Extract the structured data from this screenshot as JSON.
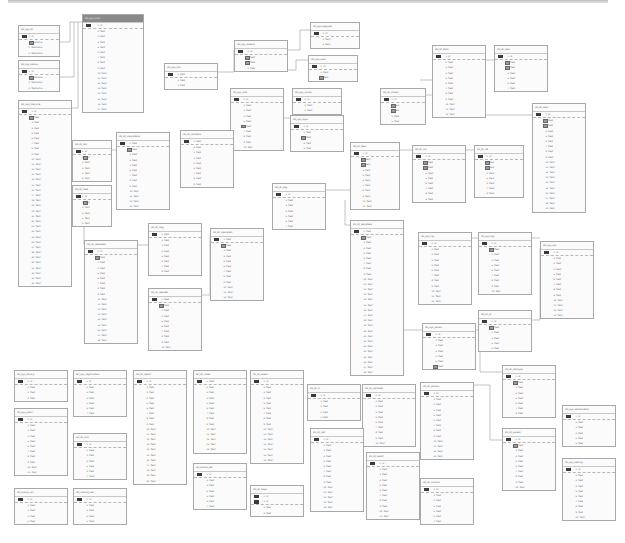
{
  "diagram": {
    "type": "entity-relationship",
    "tables": [
      {
        "name": "tbl_sys_dt",
        "x": 18,
        "y": 25,
        "w": 42,
        "rows": [
          "1. id",
          "2. fieldname",
          "3. fieldname",
          "4. fieldname"
        ],
        "fk": [
          1
        ]
      },
      {
        "name": "tbl_sys_status",
        "x": 18,
        "y": 60,
        "w": 42,
        "rows": [
          "1. id",
          "2. fieldname",
          "3. fieldname",
          "4. fieldname"
        ],
        "fk": [
          1
        ]
      },
      {
        "name": "tbl_sys_main",
        "x": 82,
        "y": 14,
        "w": 62,
        "sel": true,
        "rows": [
          "1. id",
          "2. field",
          "3. field",
          "4. field",
          "5. field",
          "6. field",
          "7. field",
          "8. field",
          "9. field",
          "10. field",
          "11. field",
          "12. field",
          "13. field",
          "14. field",
          "15. field",
          "16. field",
          "17. field"
        ]
      },
      {
        "name": "tbl_sys_lifecycle",
        "x": 18,
        "y": 100,
        "w": 54,
        "rows": [
          "1. id",
          "2. field",
          "3. field",
          "4. field",
          "5. field",
          "6. field",
          "7. field",
          "8. field",
          "9. field",
          "10. field",
          "11. field",
          "12. field",
          "13. field",
          "14. field",
          "15. field",
          "16. field",
          "17. field",
          "18. field",
          "19. field",
          "20. field",
          "21. field",
          "22. field",
          "23. field",
          "24. field",
          "25. field",
          "26. field",
          "27. field",
          "28. field",
          "29. field",
          "30. field",
          "31. field",
          "32. field",
          "33. field",
          "34. field"
        ],
        "fk": [
          1
        ]
      },
      {
        "name": "tbl_sys_link",
        "x": 164,
        "y": 63,
        "w": 54,
        "rows": [
          "1. field",
          "2. field",
          "3. field"
        ]
      },
      {
        "name": "tbl_sys_stream",
        "x": 234,
        "y": 40,
        "w": 54,
        "rows": [
          "1. id",
          "2. field",
          "3. field",
          "4. field"
        ],
        "fk": [
          1,
          2
        ]
      },
      {
        "name": "tbl_sys_role",
        "x": 230,
        "y": 88,
        "w": 54,
        "rows": [
          "1. id",
          "2. field",
          "3. field",
          "4. field",
          "5. field",
          "6. field",
          "7. field",
          "8. field",
          "9. field",
          "10. field"
        ],
        "fk": [
          5
        ]
      },
      {
        "name": "tbl_sys_tagtype",
        "x": 310,
        "y": 22,
        "w": 50,
        "rows": [
          "1. id",
          "2. field",
          "3. field"
        ]
      },
      {
        "name": "tbl_sys_user",
        "x": 308,
        "y": 55,
        "w": 50,
        "rows": [
          "1. id",
          "2. field",
          "3. field"
        ],
        "fk": [
          2
        ]
      },
      {
        "name": "tbl_sys_cursor",
        "x": 292,
        "y": 88,
        "w": 50,
        "rows": [
          "1. id",
          "2. field",
          "3. field"
        ]
      },
      {
        "name": "tbl_sys_logic",
        "x": 290,
        "y": 115,
        "w": 54,
        "rows": [
          "1. id",
          "2. field",
          "3. field",
          "4. field",
          "5. field"
        ],
        "fk": [
          2
        ]
      },
      {
        "name": "tbl_dt_data",
        "x": 432,
        "y": 45,
        "w": 54,
        "rows": [
          "1. id",
          "2. field",
          "3. field",
          "4. field",
          "5. field",
          "6. field",
          "7. field",
          "8. field",
          "9. field",
          "10. field",
          "11. field",
          "12. field"
        ]
      },
      {
        "name": "tbl_dt_task",
        "x": 494,
        "y": 45,
        "w": 54,
        "rows": [
          "1. id",
          "2. field",
          "3. field",
          "4. field",
          "5. field",
          "6. field",
          "7. field"
        ],
        "fk": [
          1,
          2
        ]
      },
      {
        "name": "tbl_dt_sched",
        "x": 380,
        "y": 88,
        "w": 46,
        "rows": [
          "1. id",
          "2. field",
          "3. field",
          "4. field",
          "5. field"
        ],
        "fk": [
          1,
          2
        ]
      },
      {
        "name": "tbl_dt_alert",
        "x": 532,
        "y": 103,
        "w": 54,
        "rows": [
          "1. id",
          "2. field",
          "3. field",
          "4. field",
          "5. field",
          "6. field",
          "7. field",
          "8. field",
          "9. field",
          "10. field",
          "11. field",
          "12. field",
          "13. field",
          "14. field",
          "15. field",
          "16. field",
          "17. field",
          "18. field",
          "19. field"
        ],
        "fk": [
          1,
          2
        ]
      },
      {
        "name": "tbl_dt_doc",
        "x": 72,
        "y": 140,
        "w": 40,
        "rows": [
          "1. id",
          "2. field",
          "3. field",
          "4. field",
          "5. field",
          "6. field"
        ],
        "fk": [
          1
        ]
      },
      {
        "name": "tbl_dt_memodata",
        "x": 116,
        "y": 132,
        "w": 54,
        "rows": [
          "1. field",
          "2. field",
          "3. field",
          "4. field",
          "5. field",
          "6. field",
          "7. field",
          "8. field",
          "9. field",
          "10. field",
          "11. field",
          "12. field",
          "13. field"
        ],
        "fk": [
          1
        ]
      },
      {
        "name": "tbl_dt_factdata",
        "x": 180,
        "y": 130,
        "w": 54,
        "rows": [
          "1. field",
          "2. field",
          "3. field",
          "4. field",
          "5. field",
          "6. field",
          "7. field",
          "8. field",
          "9. field"
        ]
      },
      {
        "name": "tbl_dt_field",
        "x": 72,
        "y": 185,
        "w": 40,
        "rows": [
          "1. id",
          "2. field",
          "3. field",
          "4. field",
          "5. field",
          "6. field"
        ],
        "fk": [
          1
        ]
      },
      {
        "name": "tbl_dt_relatedat",
        "x": 84,
        "y": 240,
        "w": 54,
        "rows": [
          "1. id",
          "2. field",
          "3. field",
          "4. field",
          "5. field",
          "6. field",
          "7. field",
          "8. field",
          "9. field",
          "10. field",
          "11. field",
          "12. field",
          "13. field",
          "14. field",
          "15. field",
          "16. field",
          "17. field",
          "18. field"
        ],
        "fk": [
          1
        ]
      },
      {
        "name": "tbl_dt_flag",
        "x": 148,
        "y": 223,
        "w": 54,
        "rows": [
          "1. field",
          "2. field",
          "3. field",
          "4. field",
          "5. field",
          "6. field",
          "7. field",
          "8. field"
        ]
      },
      {
        "name": "tbl_dt_memodat",
        "x": 210,
        "y": 228,
        "w": 54,
        "rows": [
          "1. field",
          "2. field",
          "3. field",
          "4. field",
          "5. field",
          "6. field",
          "7. field",
          "8. field",
          "9. field",
          "10. field",
          "11. field",
          "12. field"
        ],
        "fk": [
          1
        ]
      },
      {
        "name": "tbl_dt_request",
        "x": 148,
        "y": 288,
        "w": 54,
        "rows": [
          "1. field",
          "2. field",
          "3. field",
          "4. field",
          "5. field",
          "6. field",
          "7. field",
          "8. field",
          "9. field",
          "10. field"
        ],
        "fk": [
          1
        ]
      },
      {
        "name": "tbl_dt_key",
        "x": 272,
        "y": 183,
        "w": 54,
        "rows": [
          "1. id",
          "2. field",
          "3. field",
          "4. field",
          "5. field",
          "6. field",
          "7. field"
        ]
      },
      {
        "name": "tbl_dt_item",
        "x": 350,
        "y": 142,
        "w": 50,
        "rows": [
          "1. id",
          "2. field",
          "3. field",
          "4. field",
          "5. field",
          "6. field",
          "7. field",
          "8. field",
          "9. field",
          "10. field",
          "11. field"
        ],
        "fk": [
          1,
          2
        ]
      },
      {
        "name": "tbl_dt_val",
        "x": 412,
        "y": 145,
        "w": 54,
        "rows": [
          "1. id",
          "2. field",
          "3. field",
          "4. field",
          "5. field",
          "6. field",
          "7. field",
          "8. field",
          "9. field"
        ],
        "fk": [
          1,
          2
        ]
      },
      {
        "name": "tbl_dt_rel",
        "x": 474,
        "y": 145,
        "w": 50,
        "rows": [
          "1. id",
          "2. field",
          "3. field",
          "4. field",
          "5. field",
          "6. field",
          "7. field",
          "8. field"
        ],
        "fk": [
          1,
          2
        ]
      },
      {
        "name": "tbl_dt_template",
        "x": 350,
        "y": 220,
        "w": 54,
        "rows": [
          "1. field",
          "2. field",
          "3. field",
          "4. field",
          "5. field",
          "6. field",
          "7. field",
          "8. field",
          "9. field",
          "10. field",
          "11. field",
          "12. field",
          "13. field",
          "14. field",
          "15. field",
          "16. field",
          "17. field",
          "18. field",
          "19. field",
          "20. field",
          "21. field",
          "22. field",
          "23. field",
          "24. field",
          "25. field",
          "26. field",
          "27. field",
          "28. field"
        ],
        "fk": [
          1
        ]
      },
      {
        "name": "tbl_sys_cfg",
        "x": 418,
        "y": 232,
        "w": 54,
        "rows": [
          "1. id",
          "2. field",
          "3. field",
          "4. field",
          "5. field",
          "6. field",
          "7. field",
          "8. field",
          "9. field",
          "10. field",
          "11. field",
          "12. field"
        ]
      },
      {
        "name": "tbl_sys_log",
        "x": 478,
        "y": 232,
        "w": 54,
        "rows": [
          "1. id",
          "2. field",
          "3. field",
          "4. field",
          "5. field",
          "6. field",
          "7. field",
          "8. field",
          "9. field",
          "10. field"
        ],
        "fk": [
          1
        ]
      },
      {
        "name": "tbl_sys_opt",
        "x": 540,
        "y": 241,
        "w": 54,
        "rows": [
          "1. id",
          "2. field",
          "3. field",
          "4. field",
          "5. field",
          "6. field",
          "7. field",
          "8. field",
          "9. field",
          "10. field",
          "11. field",
          "12. field",
          "13. field"
        ]
      },
      {
        "name": "tbl_sys_param",
        "x": 422,
        "y": 323,
        "w": 54,
        "rows": [
          "1. id",
          "2. field",
          "3. field",
          "4. field",
          "5. field",
          "6. field",
          "7. field"
        ],
        "fk": [
          6
        ]
      },
      {
        "name": "tbl_dt_pr",
        "x": 478,
        "y": 310,
        "w": 54,
        "rows": [
          "1. id",
          "2. field",
          "3. field",
          "4. field",
          "5. field",
          "6. field"
        ],
        "fk": [
          1
        ]
      },
      {
        "name": "tbl_dt_doctype",
        "x": 502,
        "y": 365,
        "w": 54,
        "rows": [
          "1. id",
          "2. field",
          "3. field",
          "4. field",
          "5. field",
          "6. field",
          "7. field",
          "8. field"
        ],
        "fk": [
          1
        ]
      },
      {
        "name": "tbl_sys_library",
        "x": 14,
        "y": 370,
        "w": 54,
        "rows": [
          "1. id",
          "2. field",
          "3. field",
          "4. field"
        ]
      },
      {
        "name": "tbl_sys_registration",
        "x": 73,
        "y": 370,
        "w": 54,
        "rows": [
          "1. id",
          "2. field",
          "3. field",
          "4. field",
          "5. field",
          "6. field",
          "7. field"
        ]
      },
      {
        "name": "tbl_dt_report",
        "x": 133,
        "y": 370,
        "w": 54,
        "rows": [
          "1. id",
          "2. field",
          "3. field",
          "4. field",
          "5. field",
          "6. field",
          "7. field",
          "8. field",
          "9. field",
          "10. field",
          "11. field",
          "12. field",
          "13. field",
          "14. field",
          "15. field",
          "16. field",
          "17. field",
          "18. field",
          "19. field",
          "20. field"
        ]
      },
      {
        "name": "tbl_dt_node",
        "x": 193,
        "y": 370,
        "w": 54,
        "rows": [
          "1. field",
          "2. field",
          "3. field",
          "4. field",
          "5. field",
          "6. field",
          "7. field",
          "8. field",
          "9. field",
          "10. field",
          "11. field",
          "12. field",
          "13. field",
          "14. field"
        ]
      },
      {
        "name": "tbl_dt_event",
        "x": 250,
        "y": 370,
        "w": 54,
        "rows": [
          "1. id",
          "2. field",
          "3. field",
          "4. field",
          "5. field",
          "6. field",
          "7. field",
          "8. field",
          "9. field",
          "10. field",
          "11. field",
          "12. field",
          "13. field",
          "14. field",
          "15. field",
          "16. field"
        ]
      },
      {
        "name": "tbl_sys_prefs",
        "x": 14,
        "y": 408,
        "w": 54,
        "rows": [
          "1. id",
          "2. field",
          "3. field",
          "4. field",
          "5. field",
          "6. field",
          "7. field",
          "8. field",
          "9. field",
          "10. field",
          "11. field"
        ]
      },
      {
        "name": "tbl_dt_unit",
        "x": 73,
        "y": 433,
        "w": 54,
        "rows": [
          "1. id",
          "2. field",
          "3. field",
          "4. field",
          "5. field",
          "6. field",
          "7. field"
        ]
      },
      {
        "name": "tbl_status_set",
        "x": 193,
        "y": 463,
        "w": 54,
        "rows": [
          "1. id",
          "2. field",
          "3. field",
          "4. field",
          "5. field",
          "6. field",
          "7. field"
        ]
      },
      {
        "name": "tbl_dt_flags",
        "x": 250,
        "y": 485,
        "w": 54,
        "rows": [
          "1. id",
          "2. id",
          "3. field",
          "4. field"
        ],
        "pk2": true
      },
      {
        "name": "tbl_status_usr",
        "x": 14,
        "y": 488,
        "w": 54,
        "rows": [
          "1. id",
          "2. field",
          "3. field",
          "4. field",
          "5. field"
        ]
      },
      {
        "name": "tbl_routing_set",
        "x": 73,
        "y": 488,
        "w": 54,
        "rows": [
          "1. id",
          "2. field",
          "3. field",
          "4. field",
          "5. field"
        ]
      },
      {
        "name": "tbl_dt_cl",
        "x": 307,
        "y": 384,
        "w": 54,
        "rows": [
          "1. id",
          "2. field",
          "3. field",
          "4. field",
          "5. field"
        ]
      },
      {
        "name": "tbl_dt_certfield",
        "x": 362,
        "y": 384,
        "w": 54,
        "rows": [
          "1. id",
          "2. field",
          "3. field",
          "4. field",
          "5. field",
          "6. field",
          "7. field",
          "8. field",
          "9. field",
          "10. field"
        ]
      },
      {
        "name": "tbl_dt_person",
        "x": 420,
        "y": 382,
        "w": 54,
        "rows": [
          "1. id",
          "2. field",
          "3. field",
          "4. field",
          "5. field",
          "6. field",
          "7. field",
          "8. field",
          "9. field",
          "10. field",
          "11. field",
          "12. field",
          "13. field"
        ]
      },
      {
        "name": "tbl_dt_cell",
        "x": 310,
        "y": 428,
        "w": 54,
        "rows": [
          "1. id",
          "2. field",
          "3. field",
          "4. field",
          "5. field",
          "6. field",
          "7. field",
          "8. field",
          "9. field",
          "10. field",
          "11. field",
          "12. field",
          "13. field",
          "14. field"
        ]
      },
      {
        "name": "tbl_dt_task2",
        "x": 366,
        "y": 452,
        "w": 54,
        "rows": [
          "1. id",
          "2. field",
          "3. field",
          "4. field",
          "5. field",
          "6. field",
          "7. field",
          "8. field",
          "9. field",
          "10. field",
          "11. field"
        ]
      },
      {
        "name": "tbl_dt_invoice",
        "x": 420,
        "y": 478,
        "w": 54,
        "rows": [
          "1. id",
          "2. field",
          "3. field",
          "4. field",
          "5. field",
          "6. field",
          "7. field"
        ]
      },
      {
        "name": "tbl_dt_parent",
        "x": 502,
        "y": 428,
        "w": 54,
        "rows": [
          "1. id",
          "2. field",
          "3. field",
          "4. field",
          "5. field",
          "6. field",
          "7. field",
          "8. field",
          "9. field",
          "10. field"
        ],
        "fk": [
          1
        ]
      },
      {
        "name": "tbl_sys_relationdata",
        "x": 562,
        "y": 405,
        "w": 54,
        "rows": [
          "1. id",
          "2. field",
          "3. field",
          "4. field",
          "5. field",
          "6. field"
        ]
      },
      {
        "name": "tbl_sys_setting",
        "x": 562,
        "y": 458,
        "w": 54,
        "rows": [
          "1. id",
          "2. field",
          "3. field",
          "4. field",
          "5. field",
          "6. field",
          "7. field",
          "8. field",
          "9. field",
          "10. field"
        ]
      }
    ],
    "colors": {
      "border": "#a8a8a8",
      "header_selected": "#8a8a8a",
      "pk_key": "#3a3a3a",
      "fk_key": "#9a9a9a",
      "line": "#9a9a9a",
      "background": "#ffffff"
    }
  }
}
